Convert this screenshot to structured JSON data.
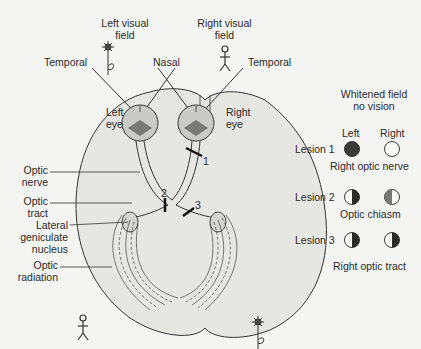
{
  "diagram": {
    "type": "visual-pathway-lesions",
    "labels": {
      "left_visual_field": "Left visual\nfield",
      "right_visual_field": "Right visual\nfield",
      "temporal_left": "Temporal",
      "nasal": "Nasal",
      "temporal_right": "Temporal",
      "left_eye": "Left\neye",
      "right_eye": "Right\neye",
      "optic_nerve": "Optic\nnerve",
      "optic_tract": "Optic\ntract",
      "lgn": "Lateral\ngeniculate\nnucleus",
      "optic_radiation": "Optic\nradiation"
    },
    "lesion_markers": [
      "1",
      "2",
      "3"
    ],
    "legend": {
      "header": "Whitened field\nno vision",
      "col_left": "Left",
      "col_right": "Right",
      "rows": [
        {
          "label": "Lesion 1",
          "caption": "Right optic nerve",
          "left": "full-dark",
          "right": "full-white"
        },
        {
          "label": "Lesion 2",
          "caption": "Optic chiasm",
          "left": "right-half-dark",
          "right": "left-half-dark"
        },
        {
          "label": "Lesion 3",
          "caption": "Right optic tract",
          "left": "right-half-dark",
          "right": "right-half-dark"
        }
      ]
    },
    "colors": {
      "background": "#f4f4f2",
      "brain_fill": "#e6e6e3",
      "line": "#333333",
      "dark_field": "#3a3a3a",
      "mid_field": "#777777"
    }
  }
}
